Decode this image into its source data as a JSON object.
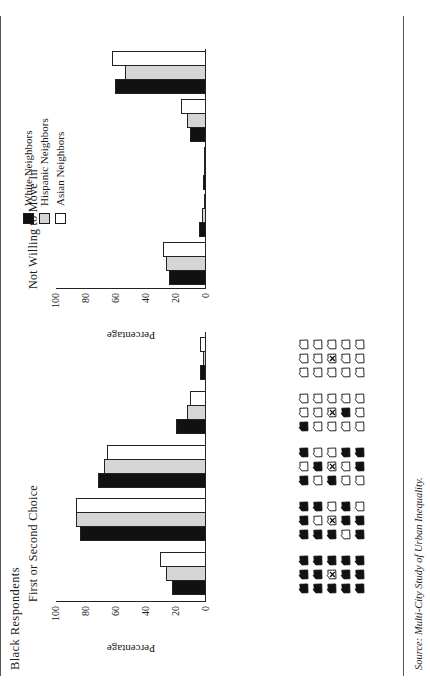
{
  "figure": {
    "title": "Black Respondents",
    "source_note": "Source: Multi-City Study of Urban Inequality.",
    "axis_label": "Percentage",
    "colors": {
      "white_neighbors": "#111111",
      "hispanic_neighbors": "#d5d5d5",
      "asian_neighbors": "#ffffff",
      "axis": "#222222"
    }
  },
  "legend": {
    "items": [
      {
        "label": "White Neighbors",
        "swatch": "black-square-icon"
      },
      {
        "label": "Hispanic Neighbors",
        "swatch": "gray-square-icon"
      },
      {
        "label": "Asian Neighbors",
        "swatch": "white-square-icon"
      }
    ]
  },
  "axis": {
    "ticks": [
      "0",
      "20",
      "40",
      "60",
      "80",
      "100"
    ],
    "min": 0,
    "max": 100,
    "label": "Percentage"
  },
  "neighborhoods": {
    "caption": "Neighborhood racial composition cards: 3x5 grid of houses; center house marked X is the respondent's own home.",
    "cards": [
      {
        "name": "all-same-race",
        "black_count": 14,
        "pattern": [
          1,
          1,
          1,
          1,
          1,
          1,
          1,
          0,
          1,
          1,
          1,
          1,
          1,
          1,
          1
        ]
      },
      {
        "name": "mostly-same-race",
        "black_count": 10,
        "pattern": [
          1,
          1,
          1,
          1,
          0,
          1,
          1,
          0,
          0,
          0,
          1,
          1,
          1,
          1,
          0
        ]
      },
      {
        "name": "half-and-half",
        "black_count": 7,
        "pattern": [
          1,
          0,
          1,
          0,
          1,
          0,
          1,
          0,
          0,
          0,
          0,
          1,
          0,
          1,
          1
        ]
      },
      {
        "name": "mostly-other-race",
        "black_count": 3,
        "pattern": [
          1,
          0,
          0,
          0,
          0,
          0,
          0,
          0,
          0,
          0,
          1,
          0,
          0,
          0,
          0
        ]
      },
      {
        "name": "all-other-race",
        "black_count": 0,
        "pattern": [
          0,
          0,
          0,
          0,
          0,
          0,
          0,
          0,
          0,
          0,
          0,
          0,
          0,
          0,
          0
        ]
      }
    ]
  },
  "chart_data": [
    {
      "type": "bar",
      "title": "First or Second Choice",
      "xlabel": "Neighborhood racial composition",
      "ylabel": "Percentage",
      "ylim": [
        0,
        100
      ],
      "grid": false,
      "legend_position": "top-right",
      "categories": [
        "All same race",
        "Mostly same race",
        "Half and half",
        "Mostly other race",
        "All other race"
      ],
      "series": [
        {
          "name": "White Neighbors",
          "values": [
            23,
            84,
            72,
            20,
            4
          ]
        },
        {
          "name": "Hispanic Neighbors",
          "values": [
            27,
            87,
            68,
            13,
            2
          ]
        },
        {
          "name": "Asian Neighbors",
          "values": [
            31,
            87,
            66,
            11,
            4
          ]
        }
      ]
    },
    {
      "type": "bar",
      "title": "Not Willing to Move In",
      "xlabel": "Neighborhood racial composition",
      "ylabel": "Percentage",
      "ylim": [
        0,
        100
      ],
      "grid": false,
      "legend_position": "top-right",
      "categories": [
        "All same race",
        "Mostly same race",
        "Half and half",
        "Mostly other race",
        "All other race"
      ],
      "series": [
        {
          "name": "White Neighbors",
          "values": [
            25,
            5,
            2,
            11,
            61
          ]
        },
        {
          "name": "Hispanic Neighbors",
          "values": [
            27,
            3,
            1,
            13,
            54
          ]
        },
        {
          "name": "Asian Neighbors",
          "values": [
            29,
            1,
            1,
            17,
            63
          ]
        }
      ]
    }
  ]
}
